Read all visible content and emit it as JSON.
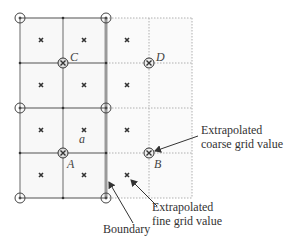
{
  "diagram": {
    "points": {
      "A": "A",
      "B": "B",
      "C": "C",
      "D": "D",
      "a": "a"
    },
    "annotations": {
      "coarse_line1": "Extrapolated",
      "coarse_line2": "coarse grid value",
      "fine_line1": "Extrapolated",
      "fine_line2": "fine grid value",
      "boundary": "Boundary"
    },
    "colors": {
      "grid_line": "#8a8a8a",
      "dotted_line": "#b0b0b0",
      "boundary": "#9a9a9a",
      "cell_fill": "#f7f7f7",
      "marker": "#333333"
    }
  }
}
